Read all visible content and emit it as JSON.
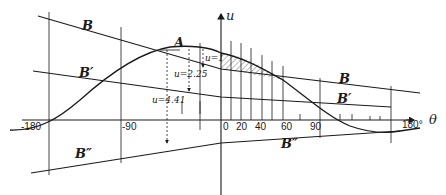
{
  "figure": {
    "axis_labels": {
      "vertical": "u",
      "horizontal": "θ"
    },
    "curve_labels": {
      "A": "A",
      "B_top": "B",
      "B_right": "B",
      "Bp_left": "B′",
      "Bp_right": "B′",
      "Bpp_left": "B″",
      "Bpp_right": "B″"
    },
    "u_annotations": [
      "u=1",
      "u=2.25",
      "u=4.41"
    ],
    "x_ticks": [
      "-180",
      "-90",
      "0",
      "20",
      "40",
      "60",
      "90",
      "180°"
    ],
    "colors": {
      "ink": "#1a1a1a",
      "background": "#ffffff",
      "hatch": "#333333"
    }
  }
}
